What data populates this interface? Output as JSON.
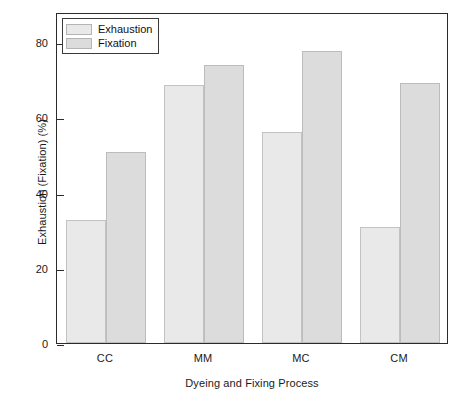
{
  "chart_data": {
    "type": "bar",
    "title": "",
    "xlabel": "Dyeing and Fixing Process",
    "ylabel": "Exhaustion (Fixation) (%)",
    "categories": [
      "CC",
      "MM",
      "MC",
      "CM"
    ],
    "series": [
      {
        "name": "Exhaustion",
        "values": [
          32.8,
          68.5,
          56.1,
          30.8
        ],
        "color": "#e9e9e9"
      },
      {
        "name": "Fixation",
        "values": [
          50.7,
          73.8,
          77.6,
          69.2
        ],
        "color": "#dcdcdc"
      }
    ],
    "ylim": [
      0,
      88
    ],
    "yticks": [
      0,
      20,
      40,
      60,
      80
    ],
    "ytick_labels": [
      "0",
      "20",
      "40",
      "60",
      "80"
    ],
    "grid": false,
    "legend_position": "top-left",
    "legend_entries": [
      "Exhaustion",
      "Fixation"
    ]
  },
  "legend": {
    "items": [
      {
        "label": "Exhaustion"
      },
      {
        "label": "Fixation"
      }
    ]
  },
  "axes": {
    "y_title": "Exhaustion (Fixation) (%)",
    "x_title": "Dyeing and Fixing Process"
  }
}
